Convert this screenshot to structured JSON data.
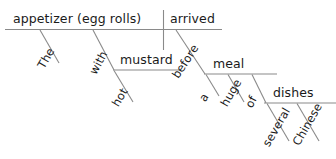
{
  "diagram": {
    "type": "reed-kellogg-sentence-diagram",
    "sentence": "The appetizer (egg rolls) arrived before a huge meal of several Chinese dishes with hot mustard",
    "stroke_color": "#8a8a8a",
    "text_color": "#1a1a1a",
    "background_color": "#ffffff",
    "words": {
      "subject": "appetizer (egg rolls)",
      "verb": "arrived",
      "subject_modifier": "The",
      "verb_prep_with": "with",
      "prep_object_mustard": "mustard",
      "mustard_modifier": "hot",
      "verb_prep_before": "before",
      "prep_object_meal": "meal",
      "meal_article": "a",
      "meal_adjective": "huge",
      "meal_prep_of": "of",
      "prep_object_dishes": "dishes",
      "dishes_quantifier": "several",
      "dishes_adjective": "Chinese"
    }
  }
}
